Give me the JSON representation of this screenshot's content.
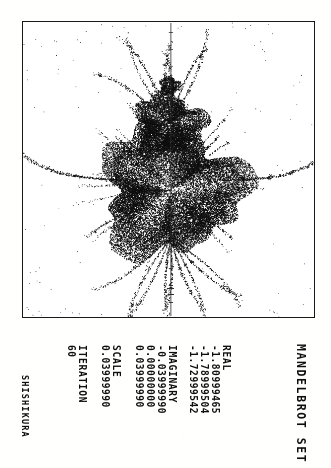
{
  "document": {
    "title": "MANDELBROT SET",
    "signature": "SHISHIKURA"
  },
  "parameters": {
    "real": {
      "label": "REAL",
      "values": [
        "-1.80999465",
        "-1.78999504",
        "-1.72999542"
      ]
    },
    "imaginary": {
      "label": "IMAGINARY",
      "values": [
        "-0.03999990",
        "0.00000000",
        "0.03999990"
      ]
    },
    "scale": {
      "label": "SCALE",
      "value": "0.03999990"
    },
    "iteration": {
      "label": "ITERATION",
      "value": "60"
    }
  },
  "colors": {
    "ink": "#111111",
    "paper": "#fdfdfc",
    "frame": "#1a1a1a"
  },
  "chart_data": {
    "type": "scatter",
    "title": "MANDELBROT SET",
    "xlabel": "REAL",
    "ylabel": "IMAGINARY",
    "xlim": [
      -1.80999465,
      -1.72999542
    ],
    "ylim": [
      -0.0399999,
      0.0399999
    ],
    "x_ticks": [
      "-1.80999465",
      "-1.78999504",
      "-1.72999542"
    ],
    "y_ticks": [
      "-0.03999990",
      "0.00000000",
      "0.03999990"
    ],
    "center": [
      -1.76999504,
      0.0
    ],
    "scale": 0.0399999,
    "max_iteration": 60,
    "grid": false,
    "legend": null,
    "rendering": "monochrome dot-matrix escape-time plot; dense filled body with radiating dotted filaments; vertical axis line with tick marks at plot center",
    "orientation_deg": 90,
    "annotations": [
      "SHISHIKURA"
    ]
  }
}
